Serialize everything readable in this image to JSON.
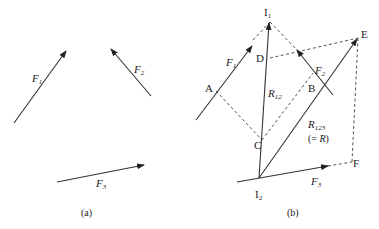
{
  "figure": {
    "panel_a": {
      "caption": "(a)",
      "forces": [
        {
          "name": "F",
          "sub": "1"
        },
        {
          "name": "F",
          "sub": "2"
        },
        {
          "name": "F",
          "sub": "3"
        }
      ]
    },
    "panel_b": {
      "caption": "(b)",
      "points": {
        "I1": {
          "name": "I",
          "sub": "1"
        },
        "I2": {
          "name": "I",
          "sub": "2"
        },
        "A": "A",
        "B": "B",
        "C": "C",
        "D": "D",
        "E": "E",
        "F": "F"
      },
      "forces": [
        {
          "name": "F",
          "sub": "1"
        },
        {
          "name": "F",
          "sub": "2"
        },
        {
          "name": "F",
          "sub": "3"
        }
      ],
      "resultants": {
        "r12": {
          "name": "R",
          "sub": "12"
        },
        "r123": {
          "name": "R",
          "sub": "123",
          "equiv_open": "(= ",
          "equiv_var": "R",
          "equiv_close": ")"
        }
      }
    }
  },
  "colors": {
    "line": "#333333",
    "dash": "#555555",
    "background": "#ffffff"
  }
}
